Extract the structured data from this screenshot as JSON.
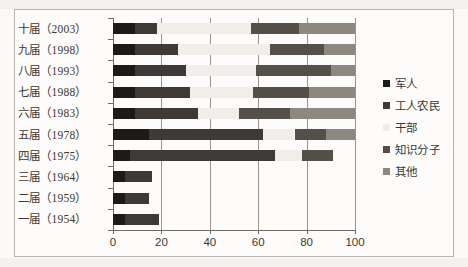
{
  "chart_data": {
    "type": "bar",
    "orientation": "horizontal",
    "stacked": true,
    "title": "",
    "subtitle": "",
    "xlabel": "",
    "ylabel": "",
    "xlim": [
      0,
      100
    ],
    "xticks": [
      0,
      20,
      40,
      60,
      80,
      100
    ],
    "xtick_labels": [
      "0",
      "20",
      "40",
      "60",
      "80",
      "100"
    ],
    "grid": true,
    "grid_axis": "x",
    "legend_position": "right",
    "categories": [
      "十届（2003）",
      "九届（1998）",
      "八届（1993）",
      "七届（1988）",
      "六届（1983）",
      "五届（1978）",
      "四届（1975）",
      "三届（1964）",
      "二届（1959）",
      "一届（1954）"
    ],
    "series": [
      {
        "name": "军人",
        "color": "#1d1a17",
        "values": [
          9,
          9,
          9,
          9,
          9,
          15,
          7,
          5,
          5,
          5
        ]
      },
      {
        "name": "工人农民",
        "color": "#3f3a35",
        "values": [
          9,
          18,
          21,
          23,
          26,
          47,
          60,
          11,
          10,
          14
        ]
      },
      {
        "name": "干部",
        "color": "#f0eee8",
        "values": [
          39,
          38,
          29,
          26,
          17,
          13,
          11,
          0,
          0,
          0
        ]
      },
      {
        "name": "知识分子",
        "color": "#545049",
        "values": [
          20,
          22,
          31,
          23,
          21,
          13,
          13,
          0,
          0,
          0
        ]
      },
      {
        "name": "其他",
        "color": "#8c8880",
        "values": [
          23,
          13,
          10,
          19,
          27,
          12,
          0,
          0,
          0,
          0
        ]
      }
    ],
    "legend_entries": [
      "军人",
      "工人农民",
      "干部",
      "知识分子",
      "其他"
    ]
  },
  "figure": {
    "background_color": "#fdfcfa",
    "frame_color": "#b9b3ab",
    "axis_color": "#6f6a64",
    "text_color": "#3b3833"
  }
}
